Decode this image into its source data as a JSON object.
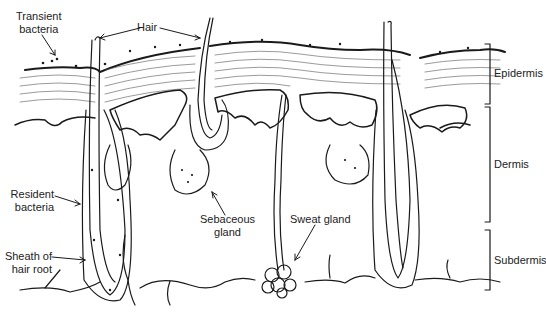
{
  "diagram": {
    "type": "anatomical cross-section",
    "labels": {
      "transient_bacteria": "Transient\nbacteria",
      "transient_bacteria_l1": "Transient",
      "transient_bacteria_l2": "bacteria",
      "hair": "Hair",
      "resident_bacteria_l1": "Resident",
      "resident_bacteria_l2": "bacteria",
      "sheath_l1": "Sheath of",
      "sheath_l2": "hair root",
      "sebaceous_l1": "Sebaceous",
      "sebaceous_l2": "gland",
      "sweat_gland": "Sweat gland"
    },
    "layers": [
      {
        "name": "Epidermis"
      },
      {
        "name": "Dermis"
      },
      {
        "name": "Subdermis"
      }
    ],
    "colors": {
      "line": "#1a1a1a",
      "background": "#ffffff"
    }
  }
}
